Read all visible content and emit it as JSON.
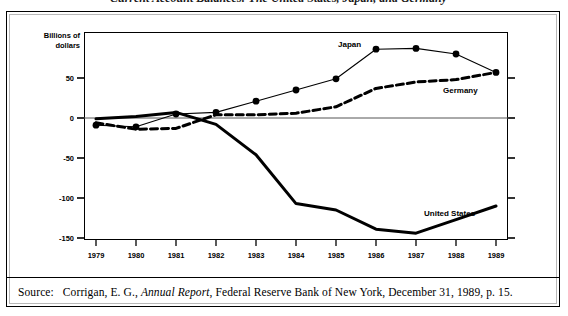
{
  "figure": {
    "title": "Current Account Balances: The United States, Japan, and Germany",
    "axis_caption_line1": "Billions of",
    "axis_caption_line2": "dollars"
  },
  "source": {
    "label": "Source:",
    "part1": "Corrigan, E. G.,",
    "italic": "Annual Report",
    "part2": ", Federal Reserve Bank of New York, December 31, 1989, p. 15."
  },
  "series_labels": {
    "japan": "Japan",
    "germany": "Germany",
    "united_states": "United States"
  },
  "colors": {
    "line": "#000000",
    "frame": "#000000",
    "zero_line": "#555555",
    "background": "#ffffff"
  },
  "chart_data": {
    "type": "line",
    "title": "Current Account Balances: The United States, Japan, and Germany",
    "xlabel": "",
    "ylabel": "Billions of dollars",
    "x": [
      1979,
      1980,
      1981,
      1982,
      1983,
      1984,
      1985,
      1986,
      1987,
      1988,
      1989
    ],
    "xtick_labels": [
      "1979",
      "1980",
      "1981",
      "1982",
      "1983",
      "1984",
      "1985",
      "1986",
      "1987",
      "1988",
      "1989"
    ],
    "ytick_labels": [
      "50",
      "0",
      "-50",
      "-100",
      "-150"
    ],
    "yticks": [
      50,
      0,
      -50,
      -100,
      -150
    ],
    "ylim": [
      -160,
      100
    ],
    "xlim": [
      1978.5,
      1989.5
    ],
    "grid": false,
    "legend": "inline-annotations",
    "series": [
      {
        "name": "United States",
        "style": "solid-thick",
        "markers": false,
        "values": [
          -1,
          2,
          7,
          -8,
          -46,
          -107,
          -115,
          -139,
          -144,
          -127,
          -110
        ]
      },
      {
        "name": "Japan",
        "style": "solid-thin",
        "markers": true,
        "values": [
          -9,
          -11,
          5,
          7,
          21,
          35,
          49,
          86,
          87,
          80,
          57
        ]
      },
      {
        "name": "Germany",
        "style": "dashed-thick",
        "markers": false,
        "values": [
          -6,
          -14,
          -13,
          4,
          4,
          6,
          14,
          37,
          45,
          48,
          57
        ]
      }
    ]
  }
}
